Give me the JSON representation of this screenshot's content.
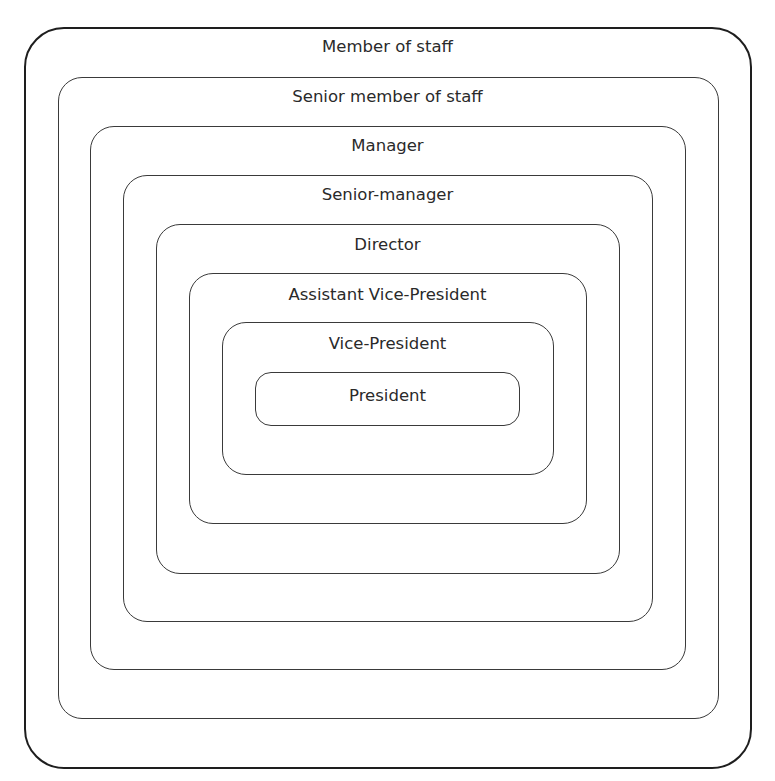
{
  "diagram": {
    "type": "nested-hierarchy",
    "levels": [
      {
        "label": "Member of staff"
      },
      {
        "label": "Senior member of staff"
      },
      {
        "label": "Manager"
      },
      {
        "label": "Senior-manager"
      },
      {
        "label": "Director"
      },
      {
        "label": "Assistant Vice-President"
      },
      {
        "label": "Vice-President"
      },
      {
        "label": "President"
      }
    ],
    "colors": {
      "line": "#3a3a3a",
      "outer_line": "#1e1e1e",
      "text": "#2a2a2a",
      "background": "#ffffff"
    }
  }
}
